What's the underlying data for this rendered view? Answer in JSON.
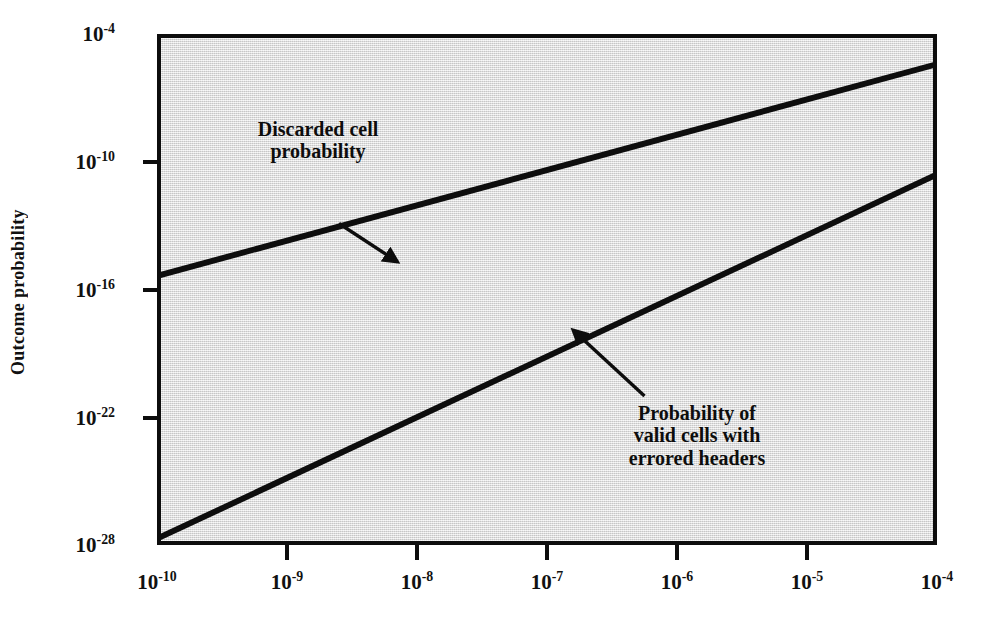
{
  "chart_data": {
    "type": "line",
    "title": "",
    "xlabel": "",
    "ylabel": "Outcome probability",
    "xscale": "log",
    "yscale": "log",
    "xlim": [
      1e-10,
      0.0001
    ],
    "ylim": [
      1e-28,
      0.0001
    ],
    "xtick_labels": [
      "10-10",
      "10-9",
      "10-8",
      "10-7",
      "10-6",
      "10-5",
      "10-4"
    ],
    "ytick_labels": [
      "10-4",
      "10-10",
      "10-16",
      "10-22",
      "10-28"
    ],
    "xtick_exponents": [
      "-10",
      "-9",
      "-8",
      "-7",
      "-6",
      "-5",
      "-4"
    ],
    "ytick_exponents": [
      "-4",
      "-10",
      "-16",
      "-22",
      "-28"
    ],
    "grid": false,
    "legend": "annotations-with-arrows",
    "series": [
      {
        "name": "Discarded cell probability",
        "x": [
          1e-10,
          0.0001
        ],
        "y_log10": [
          -15.3,
          -5.3
        ],
        "x_log10": [
          -10,
          -4
        ],
        "color": "#0d0d0d"
      },
      {
        "name": "Probability of valid cells with errored headers",
        "x": [
          1e-10,
          0.0001
        ],
        "y_log10": [
          -27.8,
          -10.6
        ],
        "x_log10": [
          -10,
          -4
        ],
        "color": "#0d0d0d"
      }
    ],
    "annotations": [
      {
        "id": "discarded",
        "lines": [
          "Discarded cell",
          "probability"
        ],
        "arrow_from_log": [
          -8.6,
          -12.9
        ],
        "arrow_to_log": [
          -8.15,
          -14.7
        ]
      },
      {
        "id": "valid",
        "lines": [
          "Probability of",
          "valid cells with",
          "errored headers"
        ],
        "arrow_from_log": [
          -6.25,
          -21.0
        ],
        "arrow_to_log": [
          -6.8,
          -17.9
        ]
      }
    ]
  },
  "axes": {
    "y_title": "Outcome probability",
    "y_ticks": [
      {
        "mantissa": "10",
        "exponent": "-4",
        "top": 34
      },
      {
        "mantissa": "10",
        "exponent": "-10",
        "top": 162
      },
      {
        "mantissa": "10",
        "exponent": "-16",
        "top": 290
      },
      {
        "mantissa": "10",
        "exponent": "-22",
        "top": 418
      },
      {
        "mantissa": "10",
        "exponent": "-28",
        "top": 545
      }
    ],
    "x_ticks": [
      {
        "mantissa": "10",
        "exponent": "-10",
        "left": 157
      },
      {
        "mantissa": "10",
        "exponent": "-9",
        "left": 287
      },
      {
        "mantissa": "10",
        "exponent": "-8",
        "left": 417
      },
      {
        "mantissa": "10",
        "exponent": "-7",
        "left": 547
      },
      {
        "mantissa": "10",
        "exponent": "-6",
        "left": 677
      },
      {
        "mantissa": "10",
        "exponent": "-5",
        "left": 807
      },
      {
        "mantissa": "10",
        "exponent": "-4",
        "left": 937
      }
    ]
  },
  "annotations": {
    "discarded": {
      "line1": "Discarded cell",
      "line2": "probability"
    },
    "valid": {
      "line1": "Probability of",
      "line2": "valid cells with",
      "line3": "errored headers"
    }
  },
  "colors": {
    "plot_background": "#e3e3e3",
    "frame": "#0d0d0d",
    "series_line": "#0d0d0d",
    "page_background": "#ffffff",
    "text": "#111111"
  }
}
